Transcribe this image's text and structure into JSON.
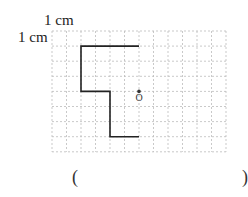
{
  "labels": {
    "horizontal_unit": "1 cm",
    "vertical_unit": "1 cm",
    "point_label": "O",
    "answer_open": "(",
    "answer_close": ")"
  },
  "grid": {
    "columns": 12,
    "rows": 8,
    "unit": "1 cm",
    "line_color": "#bbbbbb",
    "line_style": "dashed"
  },
  "figure": {
    "stroke_color": "#222222",
    "polyline_grid_points": [
      [
        6,
        1
      ],
      [
        2,
        1
      ],
      [
        2,
        4
      ],
      [
        4,
        4
      ],
      [
        4,
        7
      ],
      [
        6,
        7
      ]
    ]
  },
  "point_O": {
    "grid_position": [
      6,
      4
    ],
    "dot_color": "#333333"
  }
}
